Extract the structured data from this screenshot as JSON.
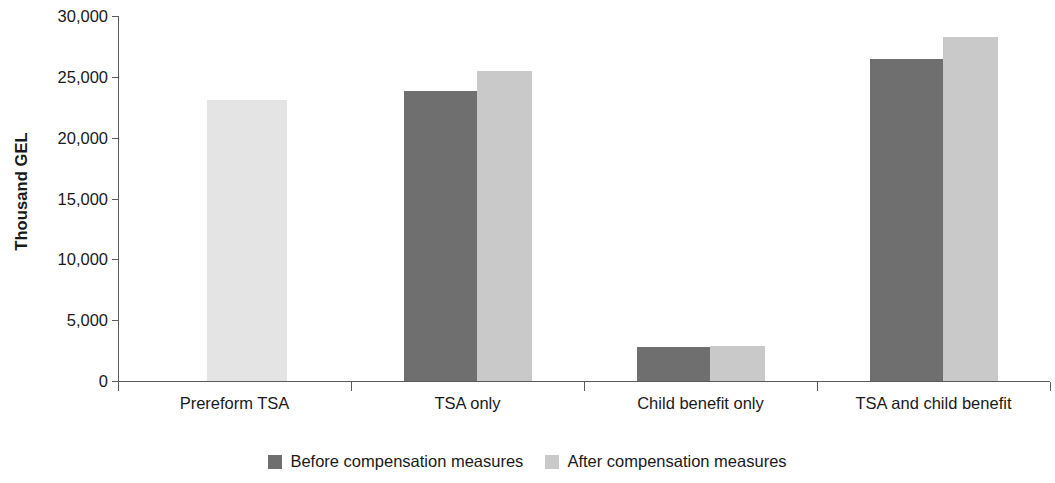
{
  "chart_data": {
    "type": "bar",
    "title": "",
    "xlabel": "",
    "ylabel": "Thousand GEL",
    "ylim": [
      0,
      30000
    ],
    "yticks": [
      "0",
      "5,000",
      "10,000",
      "15,000",
      "20,000",
      "25,000",
      "30,000"
    ],
    "ytick_values": [
      0,
      5000,
      10000,
      15000,
      20000,
      25000,
      30000
    ],
    "grid": false,
    "legend_position": "bottom-center",
    "categories": [
      "Prereform TSA",
      "TSA only",
      "Child benefit only",
      "TSA and child benefit"
    ],
    "series": [
      {
        "name": "Before compensation measures",
        "color": "#6f6f6f",
        "values": [
          null,
          23800,
          2800,
          26500
        ]
      },
      {
        "name": "After compensation measures",
        "color": "#c9c9c9",
        "values": [
          23100,
          25500,
          2900,
          28300
        ]
      }
    ]
  },
  "axes": {
    "y_title": "Thousand GEL"
  },
  "legend": {
    "items": [
      {
        "label": "Before compensation measures",
        "color": "#6f6f6f"
      },
      {
        "label": "After compensation measures",
        "color": "#c9c9c9"
      }
    ]
  },
  "colors": {
    "before": "#6f6f6f",
    "after": "#c9c9c9",
    "prereform_after": "#e4e4e4",
    "axis": "#5a5a5a",
    "text": "#1a1a1a",
    "background": "#ffffff"
  }
}
